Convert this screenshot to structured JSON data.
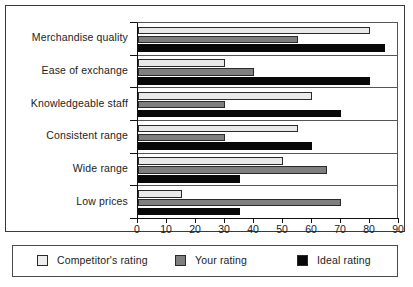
{
  "chart_data": {
    "type": "bar",
    "orientation": "horizontal",
    "title": "",
    "xlabel": "",
    "ylabel": "",
    "xlim": [
      0,
      90
    ],
    "xticks": [
      0,
      10,
      20,
      30,
      40,
      50,
      60,
      70,
      80,
      90
    ],
    "grid": false,
    "legend_position": "bottom",
    "categories": [
      "Merchandise quality",
      "Ease of exchange",
      "Knowledgeable staff",
      "Consistent range",
      "Wide range",
      "Low prices"
    ],
    "series": [
      {
        "name": "Competitor's rating",
        "color": "#e9e9e9",
        "values": [
          80,
          30,
          60,
          55,
          50,
          15
        ]
      },
      {
        "name": "Your rating",
        "color": "#7f7f7f",
        "values": [
          55,
          40,
          30,
          30,
          65,
          70
        ]
      },
      {
        "name": "Ideal rating",
        "color": "#080808",
        "values": [
          85,
          80,
          70,
          60,
          35,
          35
        ]
      }
    ]
  },
  "axis": {
    "tick_labels": [
      "0",
      "10",
      "20",
      "30",
      "40",
      "50",
      "60",
      "70",
      "80",
      "90"
    ]
  },
  "legend": {
    "items": [
      {
        "label": "Competitor's rating",
        "swatch": "light"
      },
      {
        "label": "Your rating",
        "swatch": "gray"
      },
      {
        "label": "Ideal rating",
        "swatch": "black"
      }
    ]
  }
}
